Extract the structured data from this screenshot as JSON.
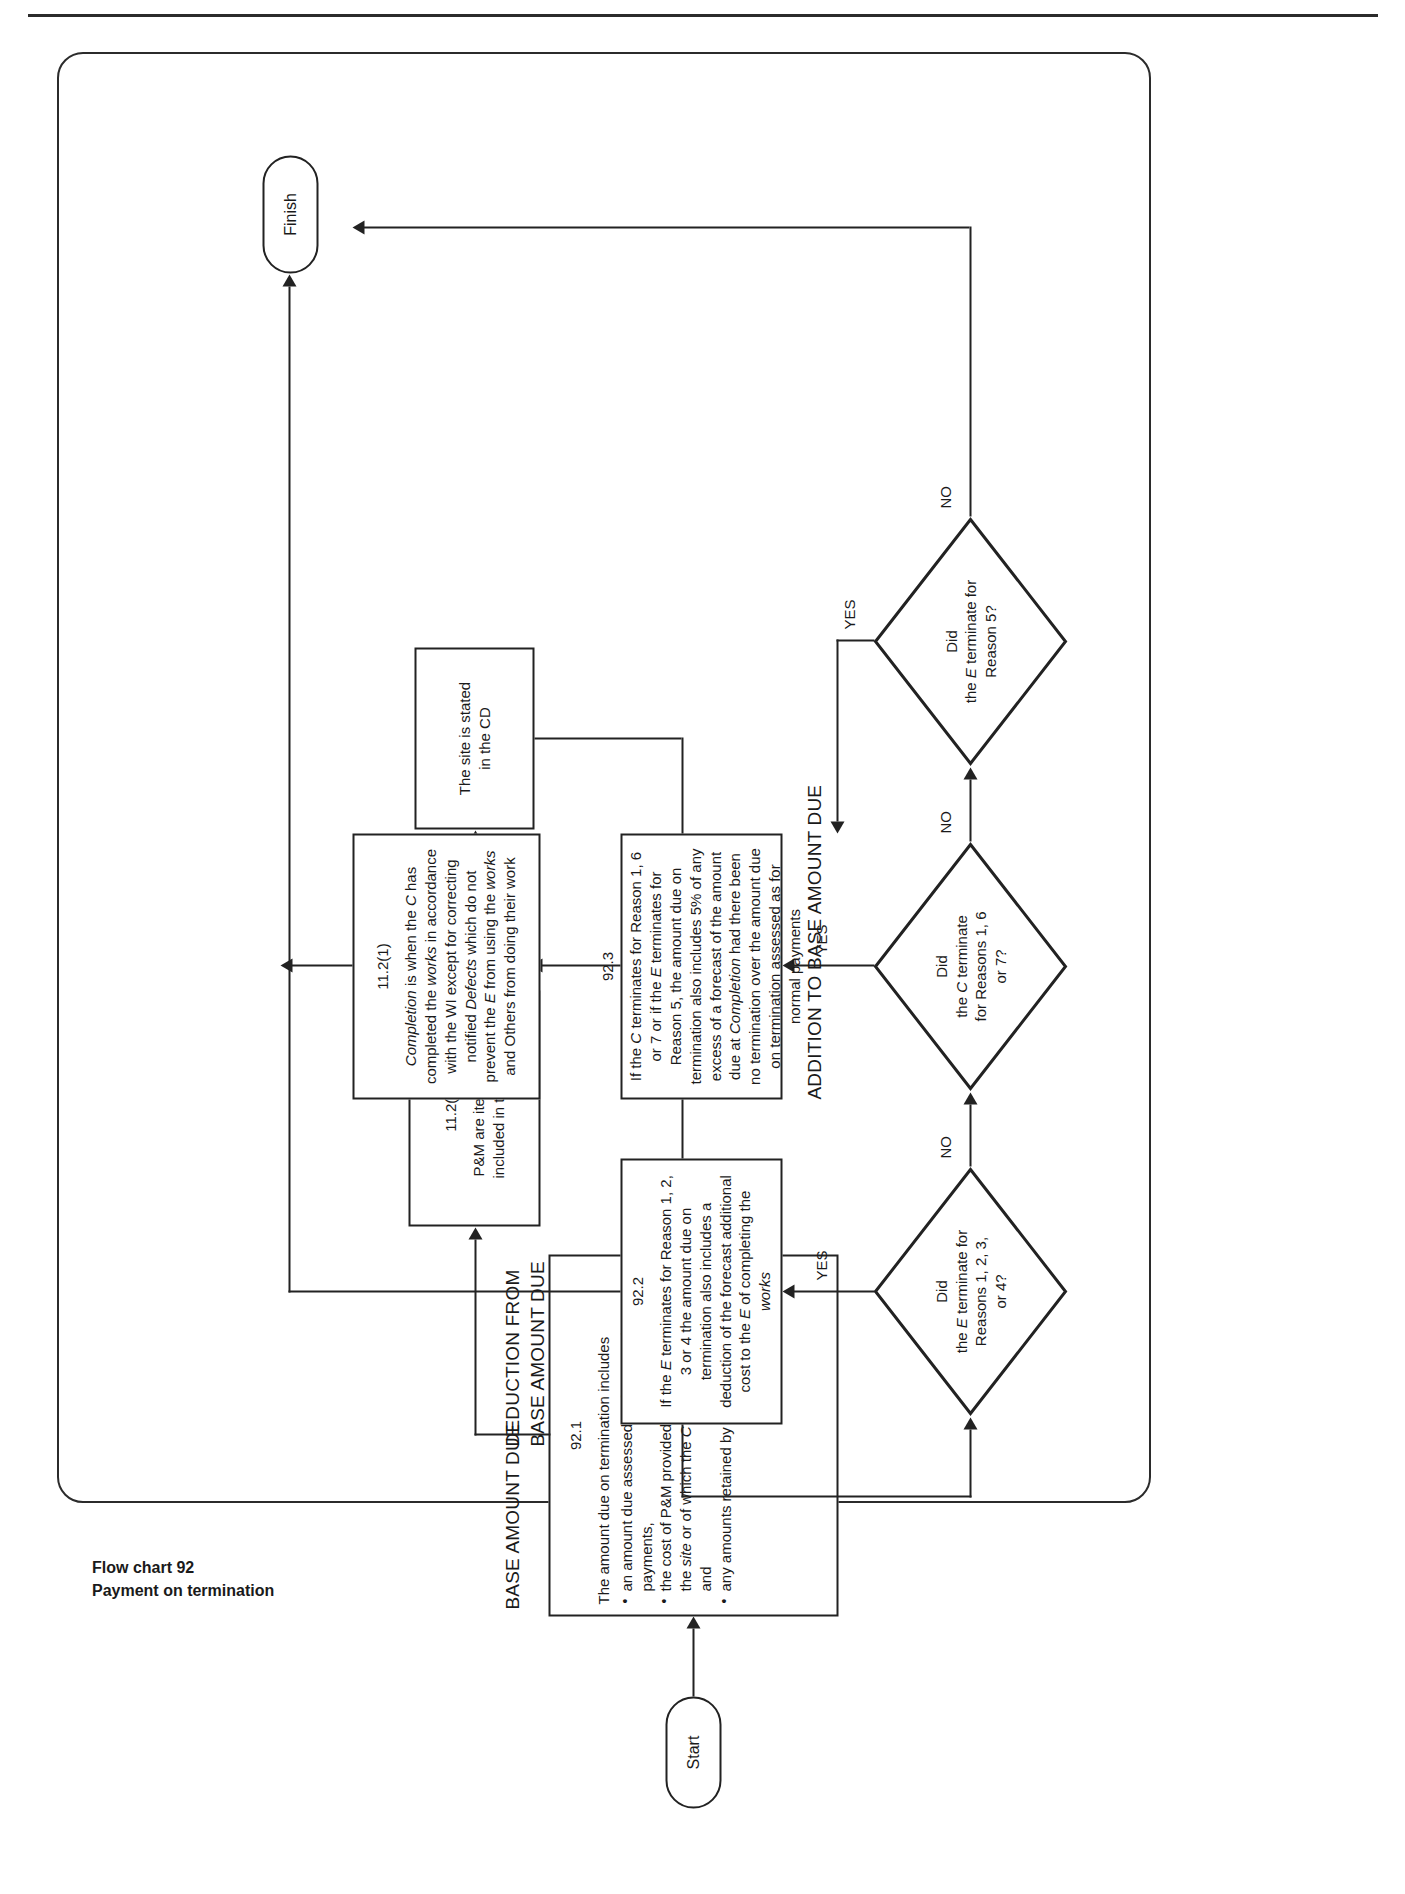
{
  "document": {
    "footer_line1": "Flow chart 92",
    "footer_line2": "Payment on termination"
  },
  "terminators": {
    "start": "Start",
    "finish": "Finish"
  },
  "captions": {
    "base_amount_due": "BASE AMOUNT DUE",
    "deduction_line1": "DEDUCTION FROM",
    "deduction_line2": "BASE AMOUNT DUE",
    "addition": "ADDITION TO BASE AMOUNT DUE"
  },
  "boxes": {
    "b921": {
      "num": "92.1",
      "intro1": "The amount due on termination includes",
      "bullets": [
        "an amount due assessed as for normal payments,",
        "the cost of P&M provided by the C which are on the site or of which the C has to accept delivery and",
        "any amounts retained by the E"
      ]
    },
    "b1128": {
      "num": "11.2(8)",
      "line1": "P&M are items to be",
      "line2": "included in the works"
    },
    "site": {
      "line1": "The site is stated",
      "line2": "in the CD"
    },
    "b922": {
      "num": "92.2",
      "text": "If the E terminates for Reason 1, 2, 3 or 4 the amount due on termination also includes a deduction of the forecast additional cost to the E of completing the works"
    },
    "b923": {
      "num": "92.3",
      "text": "If the C terminates for Reason 1, 6 or 7 or if the E terminates for Reason 5, the amount due on termination also includes 5% of any excess of a forecast of the amount due at Completion had there been no termination over the amount due on termination assessed as for normal payments"
    },
    "b1121": {
      "num": "11.2(1)",
      "text": "Completion is when the C has completed the works in accordance with the WI except for correcting notified Defects which do not prevent the E from using the works and Others from doing their work"
    }
  },
  "decisions": {
    "d1": {
      "l1": "Did",
      "l2": "the E terminate for",
      "l3": "Reasons 1, 2, 3,",
      "l4": "or 4?",
      "yes": "YES",
      "no": "NO"
    },
    "d2": {
      "l1": "Did",
      "l2": "the C terminate",
      "l3": "for Reasons 1, 6",
      "l4": "or 7?",
      "yes": "YES",
      "no": "NO"
    },
    "d3": {
      "l1": "Did",
      "l2": "the E terminate for",
      "l3": "Reason 5?",
      "l4": "",
      "yes": "YES",
      "no": "NO"
    }
  }
}
